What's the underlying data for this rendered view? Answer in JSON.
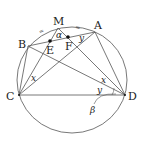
{
  "figure": {
    "type": "circle-geometry",
    "points": {
      "M": {
        "label": "M"
      },
      "A": {
        "label": "A"
      },
      "B": {
        "label": "B"
      },
      "C": {
        "label": "C"
      },
      "D": {
        "label": "D"
      },
      "E": {
        "label": "E"
      },
      "F": {
        "label": "F"
      }
    },
    "angles": {
      "alpha": "α",
      "x_at_C": "x",
      "x_at_D": "x",
      "y_at_A": "y",
      "y_at_D": "y",
      "beta": "β"
    },
    "equal_arc_marks": [
      "=",
      "="
    ]
  }
}
